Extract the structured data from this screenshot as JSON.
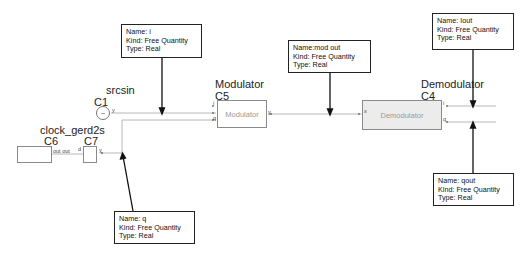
{
  "blocks": {
    "srcsin": {
      "name": "srcsin",
      "id": "C1",
      "port_out": "y"
    },
    "modulator": {
      "name": "Modulator",
      "id": "C5",
      "body": "Modulator",
      "ports_in": [
        "i",
        "q"
      ],
      "port_out": "y"
    },
    "demodulator": {
      "name": "Demodulator",
      "id": "C4",
      "body": "Demodulator",
      "port_in": "x",
      "ports_out": [
        "i",
        "q"
      ]
    },
    "clock": {
      "name": "clock_gerd2s",
      "id_left": "C6",
      "id_right": "C7",
      "port_link": "out out",
      "port_d": "d",
      "port_out": "y"
    }
  },
  "annotations": {
    "i": {
      "name": "Name: i",
      "kind": "Kind: Free Quantity",
      "type": "Type: Real"
    },
    "mod_out": {
      "name": "Name:mod out",
      "kind": "Kind: Free Quantity",
      "type": "Type: Real"
    },
    "iout": {
      "name": "Name: Iout",
      "kind": "Kind: Free Quantity",
      "type": "Type: Real"
    },
    "qout": {
      "name": "Name: qout",
      "kind": "Kind: Free Quantity",
      "type": "Type: Real"
    },
    "q": {
      "name": "Name: q",
      "kind": "Kind: Free Quantity",
      "type": "Type: Real"
    }
  },
  "colors": {
    "wire": "#b8b8b8",
    "arrow": "#111111",
    "block_border": "#8a8a8a",
    "demod_fill": "#ececec"
  }
}
